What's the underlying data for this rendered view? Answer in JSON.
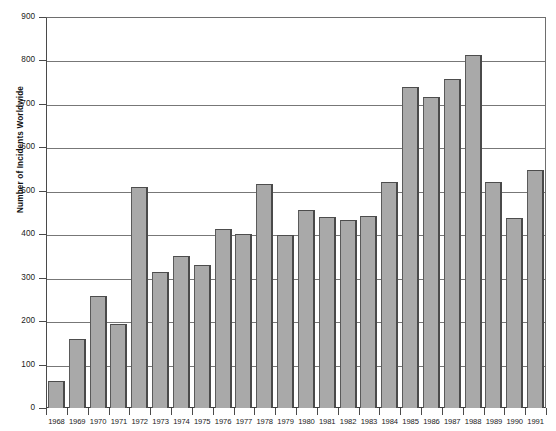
{
  "chart_data": {
    "type": "bar",
    "title": "",
    "xlabel": "",
    "ylabel": "Number of Incidents Worldwide",
    "ylim": [
      0,
      900
    ],
    "ytick_step": 100,
    "grid": true,
    "legend": null,
    "bar_color": "#a9a9a9",
    "bar_edge_color": "#4d4d4d",
    "axis_color": "#4a4a4a",
    "gridline_color": "#777777",
    "categories": [
      "1968",
      "1969",
      "1970",
      "1971",
      "1972",
      "1973",
      "1974",
      "1975",
      "1976",
      "1977",
      "1978",
      "1979",
      "1980",
      "1981",
      "1982",
      "1983",
      "1984",
      "1985",
      "1986",
      "1987",
      "1988",
      "1989",
      "1990",
      "1991"
    ],
    "values": [
      62,
      158,
      258,
      194,
      508,
      312,
      350,
      330,
      411,
      400,
      516,
      399,
      456,
      440,
      432,
      441,
      520,
      738,
      716,
      758,
      812,
      520,
      437,
      549
    ],
    "ytick_labels": [
      "0",
      "100",
      "200",
      "300",
      "400",
      "500",
      "600",
      "700",
      "800",
      "900"
    ],
    "ytick_values": [
      0,
      100,
      200,
      300,
      400,
      500,
      600,
      700,
      800,
      900
    ]
  }
}
